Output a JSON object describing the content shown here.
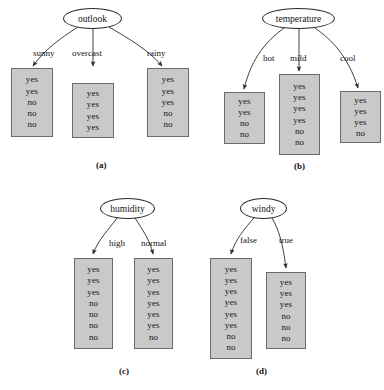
{
  "figure": {
    "background_color": "#ffffff",
    "box_fill_color": "#c9c9c9",
    "box_border_color": "#6b6b6b",
    "line_color": "#2a2a2a"
  },
  "panels": [
    {
      "caption": "(a)",
      "root": {
        "label": "outlook"
      },
      "branches": [
        {
          "label": "sunny",
          "values": [
            "yes",
            "yes",
            "no",
            "no",
            "no"
          ]
        },
        {
          "label": "overcast",
          "values": [
            "yes",
            "yes",
            "yes",
            "yes"
          ]
        },
        {
          "label": "rainy",
          "values": [
            "yes",
            "yes",
            "yes",
            "no",
            "no"
          ]
        }
      ]
    },
    {
      "caption": "(b)",
      "root": {
        "label": "temperature"
      },
      "branches": [
        {
          "label": "hot",
          "values": [
            "yes",
            "yes",
            "no",
            "no"
          ]
        },
        {
          "label": "mild",
          "values": [
            "yes",
            "yes",
            "yes",
            "yes",
            "no",
            "no"
          ]
        },
        {
          "label": "cool",
          "values": [
            "yes",
            "yes",
            "yes",
            "no"
          ]
        }
      ]
    },
    {
      "caption": "(c)",
      "root": {
        "label": "humidity"
      },
      "branches": [
        {
          "label": "high",
          "values": [
            "yes",
            "yes",
            "yes",
            "no",
            "no",
            "no",
            "no"
          ]
        },
        {
          "label": "normal",
          "values": [
            "yes",
            "yes",
            "yes",
            "yes",
            "yes",
            "yes",
            "no"
          ]
        }
      ]
    },
    {
      "caption": "(d)",
      "root": {
        "label": "windy"
      },
      "branches": [
        {
          "label": "false",
          "values": [
            "yes",
            "yes",
            "yes",
            "yes",
            "yes",
            "yes",
            "no",
            "no"
          ]
        },
        {
          "label": "true",
          "values": [
            "yes",
            "yes",
            "yes",
            "no",
            "no",
            "no"
          ]
        }
      ]
    }
  ]
}
